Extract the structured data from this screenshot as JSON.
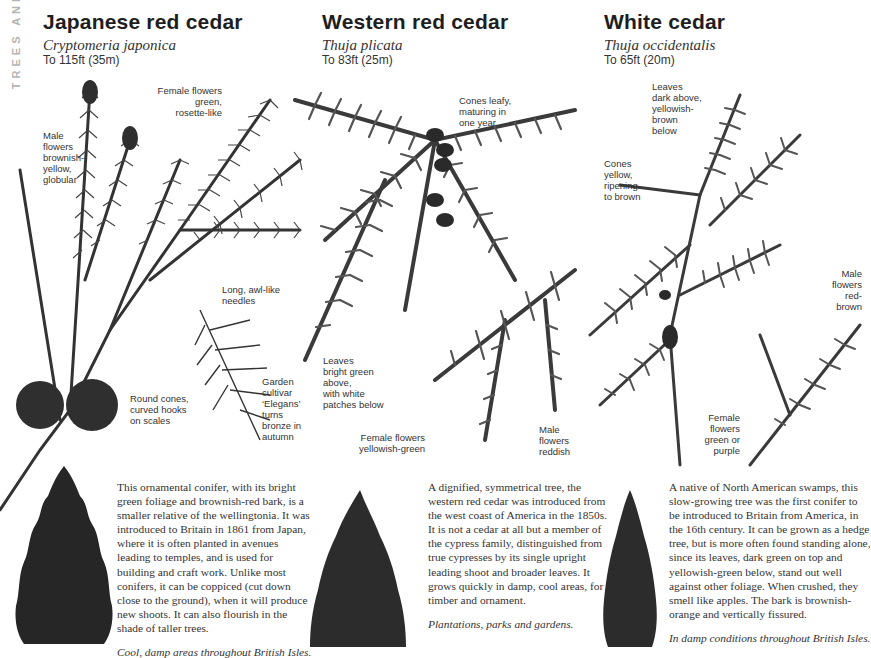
{
  "section_tab": "TREES AND",
  "species": [
    {
      "common_name": "Japanese red cedar",
      "latin_name": "Cryptomeria japonica",
      "max_height": "To 115ft (35m)",
      "labels": {
        "male_flowers": "Male\nflowers\nbrownish-\nyellow,\nglobular",
        "female_flowers": "Female flowers\ngreen,\nrosette-like",
        "needles": "Long, awl-like\nneedles",
        "cones": "Round cones,\ncurved hooks\non scales",
        "cultivar": "Garden\ncultivar\n‘Elegans’\nturns\nbronze in\nautumn"
      },
      "description": "This ornamental conifer, with its bright green foliage and brownish-red bark, is a smaller relative of the wellingtonia. It was introduced to Britain in 1861 from Japan, where it is often planted in avenues leading to temples, and is used for building and craft work. Unlike most conifers, it can be coppiced (cut down close to the ground), when it will produce new shoots. It can also flourish in the shade of taller trees.",
      "habitat": "Cool, damp areas throughout British Isles."
    },
    {
      "common_name": "Western red cedar",
      "latin_name": "Thuja plicata",
      "max_height": "To 83ft (25m)",
      "labels": {
        "cones": "Cones leafy,\nmaturing in\none year",
        "leaves": "Leaves\nbright green\nabove,\nwith white\npatches below",
        "female_flowers": "Female flowers\nyellowish-green",
        "male_flowers": "Male\nflowers\nreddish"
      },
      "description": "A dignified, symmetrical tree, the western red cedar was introduced from the west coast of America in the 1850s. It is not a cedar at all but a member of the cypress family, distinguished from true cypresses by its single upright leading shoot and broader leaves. It grows quickly in damp, cool areas, for timber and ornament.",
      "habitat": "Plantations, parks and gardens."
    },
    {
      "common_name": "White cedar",
      "latin_name": "Thuja occidentalis",
      "max_height": "To 65ft (20m)",
      "labels": {
        "leaves": "Leaves\ndark above,\nyellowish-\nbrown\nbelow",
        "cones": "Cones\nyellow,\nripening\nto brown",
        "male_flowers": "Male\nflowers\nred-\nbrown",
        "female_flowers": "Female\nflowers\ngreen or\npurple"
      },
      "description": "A native of North American swamps, this slow-growing tree was the first conifer to be introduced to Britain from America, in the 16th century. It can be grown as a hedge tree, but is more often found standing alone, since its leaves, dark green on top and yellowish-green below, stand out well against other foliage. When crushed, they smell like apples. The bark is brownish-orange and vertically fissured.",
      "habitat": "In damp conditions throughout British Isles."
    }
  ],
  "colors": {
    "ink": "#2a2a2a",
    "foliage": "#3a3a3a",
    "side_tab": "#b5b5b5"
  }
}
